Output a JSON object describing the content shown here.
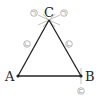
{
  "diagram": {
    "type": "triangle-construction",
    "vertices": {
      "A": {
        "label": "A",
        "x": 18,
        "y": 76
      },
      "B": {
        "label": "B",
        "x": 81,
        "y": 76
      },
      "C": {
        "label": "C",
        "x": 49,
        "y": 20
      }
    },
    "marks": [
      {
        "id": "mark-c-left",
        "label": "ㄱ",
        "x": 34,
        "y": 13
      },
      {
        "id": "mark-c-right",
        "label": "ㄱ",
        "x": 64,
        "y": 13
      },
      {
        "id": "mark-side-ac",
        "label": "ㄴ",
        "x": 27,
        "y": 44
      },
      {
        "id": "mark-side-bc",
        "label": "ㄴ",
        "x": 69,
        "y": 44
      },
      {
        "id": "mark-b-below",
        "label": "ㄷ",
        "x": 81,
        "y": 91
      }
    ],
    "colors": {
      "line": "#222222",
      "mark": "#888888"
    }
  }
}
